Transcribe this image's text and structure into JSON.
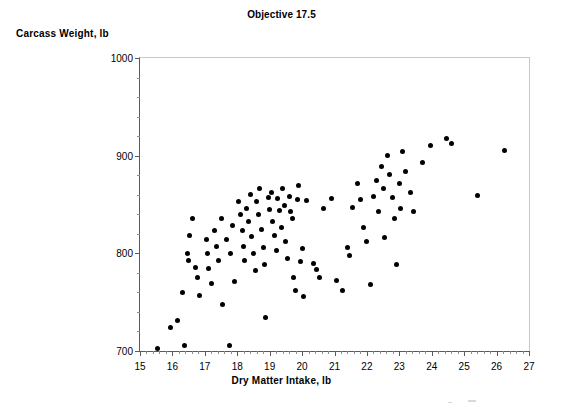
{
  "chart_data": {
    "type": "scatter",
    "title": "Objective 17.5",
    "xlabel": "Dry Matter Intake, lb",
    "ylabel": "Carcass Weight, lb",
    "xlim": [
      15,
      27
    ],
    "ylim": [
      700,
      1000
    ],
    "x_ticks": [
      15,
      16,
      17,
      18,
      19,
      20,
      21,
      22,
      23,
      24,
      25,
      26,
      27
    ],
    "y_ticks": [
      700,
      800,
      900,
      1000
    ],
    "x_minor_ticks_per_interval": 5,
    "y_minor_ticks_per_interval": 5,
    "grid": false,
    "legend": null,
    "marker": {
      "shape": "circle",
      "color": "#000000",
      "size_px": 5
    },
    "n_points": 106,
    "points": [
      [
        15.55,
        703
      ],
      [
        15.95,
        724
      ],
      [
        16.15,
        731
      ],
      [
        16.38,
        706
      ],
      [
        16.3,
        760
      ],
      [
        16.45,
        800
      ],
      [
        16.5,
        793
      ],
      [
        16.52,
        818
      ],
      [
        16.72,
        786
      ],
      [
        16.78,
        775
      ],
      [
        16.85,
        757
      ],
      [
        16.62,
        836
      ],
      [
        17.05,
        814
      ],
      [
        17.08,
        800
      ],
      [
        17.12,
        784
      ],
      [
        17.22,
        769
      ],
      [
        17.3,
        823
      ],
      [
        17.35,
        807
      ],
      [
        17.42,
        793
      ],
      [
        17.5,
        836
      ],
      [
        17.55,
        748
      ],
      [
        17.75,
        706
      ],
      [
        17.68,
        814
      ],
      [
        17.8,
        800
      ],
      [
        17.85,
        829
      ],
      [
        17.92,
        771
      ],
      [
        18.05,
        853
      ],
      [
        18.1,
        840
      ],
      [
        18.15,
        823
      ],
      [
        18.18,
        807
      ],
      [
        18.22,
        793
      ],
      [
        18.28,
        846
      ],
      [
        18.35,
        833
      ],
      [
        18.4,
        860
      ],
      [
        18.45,
        817
      ],
      [
        18.5,
        800
      ],
      [
        18.55,
        782
      ],
      [
        18.6,
        853
      ],
      [
        18.65,
        840
      ],
      [
        18.7,
        866
      ],
      [
        18.75,
        824
      ],
      [
        18.8,
        806
      ],
      [
        18.85,
        789
      ],
      [
        18.88,
        734
      ],
      [
        18.95,
        857
      ],
      [
        19.0,
        845
      ],
      [
        19.05,
        862
      ],
      [
        19.1,
        833
      ],
      [
        19.15,
        818
      ],
      [
        19.2,
        803
      ],
      [
        19.25,
        856
      ],
      [
        19.3,
        844
      ],
      [
        19.35,
        826
      ],
      [
        19.4,
        866
      ],
      [
        19.45,
        849
      ],
      [
        19.5,
        812
      ],
      [
        19.55,
        795
      ],
      [
        19.6,
        858
      ],
      [
        19.65,
        843
      ],
      [
        19.7,
        836
      ],
      [
        19.75,
        775
      ],
      [
        19.8,
        762
      ],
      [
        19.85,
        855
      ],
      [
        19.9,
        869
      ],
      [
        19.95,
        792
      ],
      [
        20.0,
        805
      ],
      [
        20.05,
        756
      ],
      [
        20.15,
        854
      ],
      [
        20.35,
        790
      ],
      [
        20.45,
        783
      ],
      [
        20.55,
        775
      ],
      [
        20.65,
        846
      ],
      [
        20.9,
        856
      ],
      [
        21.05,
        772
      ],
      [
        21.25,
        762
      ],
      [
        21.4,
        806
      ],
      [
        21.45,
        798
      ],
      [
        21.55,
        847
      ],
      [
        21.7,
        871
      ],
      [
        21.8,
        855
      ],
      [
        21.9,
        826
      ],
      [
        22.0,
        812
      ],
      [
        22.1,
        768
      ],
      [
        22.2,
        858
      ],
      [
        22.3,
        875
      ],
      [
        22.35,
        843
      ],
      [
        22.45,
        889
      ],
      [
        22.5,
        866
      ],
      [
        22.55,
        816
      ],
      [
        22.65,
        900
      ],
      [
        22.7,
        881
      ],
      [
        22.8,
        857
      ],
      [
        22.85,
        836
      ],
      [
        22.9,
        789
      ],
      [
        23.0,
        871
      ],
      [
        23.05,
        846
      ],
      [
        23.1,
        904
      ],
      [
        23.2,
        884
      ],
      [
        23.35,
        862
      ],
      [
        23.45,
        843
      ],
      [
        23.7,
        893
      ],
      [
        23.95,
        910
      ],
      [
        24.45,
        918
      ],
      [
        24.6,
        912
      ],
      [
        25.4,
        859
      ],
      [
        26.25,
        905
      ]
    ]
  },
  "chart": {
    "title": "Objective 17.5",
    "y_axis_title": "Carcass Weight, lb",
    "x_axis_title": "Dry Matter Intake, lb"
  }
}
